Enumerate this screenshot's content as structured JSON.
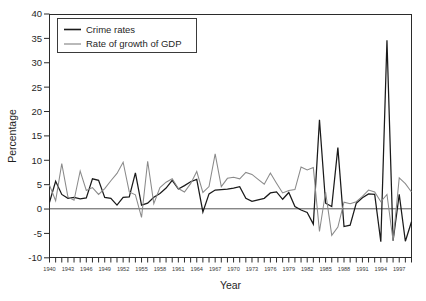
{
  "figure": {
    "background": "#ffffff",
    "axis_title_x": "Year",
    "axis_title_y": "Percentage"
  },
  "legend": {
    "position": "top-left-inside",
    "items": [
      {
        "label": "Crime rates",
        "color": "#1a1a1a"
      },
      {
        "label": "Rate of growth of GDP",
        "color": "#8a8a8a"
      }
    ]
  },
  "axes": {
    "y_ticks": [
      "40",
      "35",
      "30",
      "25",
      "20",
      "15",
      "10",
      "5",
      "0",
      "-5",
      "-10"
    ],
    "x_ticks": [
      "1940",
      "1943",
      "1946",
      "1949",
      "1952",
      "1955",
      "1958",
      "1961",
      "1964",
      "1967",
      "1970",
      "1973",
      "1976",
      "1979",
      "1982",
      "1985",
      "1988",
      "1991",
      "1994",
      "1997"
    ]
  },
  "chart_data": {
    "type": "line",
    "title": "",
    "xlabel": "Year",
    "ylabel": "Percentage",
    "xlim": [
      1940,
      1999
    ],
    "ylim": [
      -10,
      40
    ],
    "ytick_step": 5,
    "xtick_step_labeled": 3,
    "grid": false,
    "legend_position": "upper left inside axes",
    "x": [
      1940,
      1941,
      1942,
      1943,
      1944,
      1945,
      1946,
      1947,
      1948,
      1949,
      1950,
      1951,
      1952,
      1953,
      1954,
      1955,
      1956,
      1957,
      1958,
      1959,
      1960,
      1961,
      1962,
      1963,
      1964,
      1965,
      1966,
      1967,
      1968,
      1969,
      1970,
      1971,
      1972,
      1973,
      1974,
      1975,
      1976,
      1977,
      1978,
      1979,
      1980,
      1981,
      1982,
      1983,
      1984,
      1985,
      1986,
      1987,
      1988,
      1989,
      1990,
      1991,
      1992,
      1993,
      1994,
      1995,
      1996,
      1997,
      1998,
      1999
    ],
    "series": [
      {
        "name": "Crime rates",
        "color": "#1a1a1a",
        "values": [
          1.4,
          5.7,
          3.0,
          2.2,
          2.4,
          2.1,
          2.3,
          6.2,
          5.9,
          2.4,
          2.2,
          0.8,
          2.4,
          2.5,
          7.4,
          0.8,
          1.2,
          2.4,
          3.2,
          4.3,
          5.9,
          4.1,
          4.8,
          5.6,
          6.1,
          -0.6,
          3.1,
          3.9,
          4.0,
          4.1,
          4.3,
          4.6,
          2.2,
          1.6,
          1.9,
          2.2,
          3.3,
          3.5,
          2.0,
          3.4,
          0.5,
          -0.2,
          -0.7,
          -3.1,
          18.3,
          1.2,
          0.5,
          12.6,
          -3.6,
          -3.3,
          1.2,
          2.3,
          3.1,
          3.0,
          -6.7,
          34.6,
          -6.5,
          3.0,
          -6.6,
          -2.6
        ]
      },
      {
        "name": "Rate of growth of GDP",
        "color": "#8a8a8a",
        "values": [
          4.9,
          1.7,
          9.3,
          2.5,
          1.8,
          7.8,
          3.8,
          4.4,
          3.0,
          4.2,
          5.8,
          7.3,
          9.6,
          3.5,
          2.9,
          -1.7,
          9.8,
          1.1,
          4.4,
          5.5,
          6.2,
          4.2,
          3.5,
          5.2,
          7.7,
          3.4,
          4.6,
          11.3,
          4.6,
          6.3,
          6.5,
          6.2,
          7.5,
          7.1,
          6.1,
          5.1,
          7.4,
          5.3,
          3.3,
          3.8,
          4.0,
          8.6,
          8.0,
          8.5,
          -4.6,
          3.5,
          -5.4,
          -3.7,
          1.4,
          1.1,
          1.5,
          2.6,
          3.9,
          3.5,
          1.5,
          3.0,
          -6.5,
          6.4,
          5.2,
          3.5
        ]
      }
    ]
  }
}
